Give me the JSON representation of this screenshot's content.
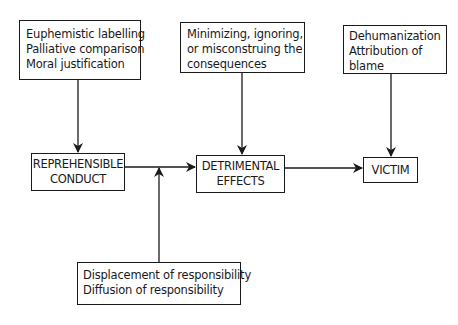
{
  "diagram": {
    "top_boxes": {
      "left": {
        "lines": [
          "Euphemistic labelling",
          "Palliative comparison",
          "Moral justification"
        ]
      },
      "middle": {
        "lines": [
          "Minimizing, ignoring,",
          "or misconstruing the",
          "consequences"
        ]
      },
      "right": {
        "lines": [
          "Dehumanization",
          "Attribution of",
          "blame"
        ]
      }
    },
    "main_boxes": {
      "conduct": {
        "lines": [
          "REPREHENSIBLE",
          "CONDUCT"
        ]
      },
      "effects": {
        "lines": [
          "DETRIMENTAL",
          "EFFECTS"
        ]
      },
      "victim": {
        "lines": [
          "VICTIM"
        ]
      }
    },
    "bottom_box": {
      "lines": [
        "Displacement of responsibility",
        "Diffusion of responsibility"
      ]
    },
    "colors": {
      "stroke": "#1a1a1a",
      "background": "#ffffff"
    }
  }
}
